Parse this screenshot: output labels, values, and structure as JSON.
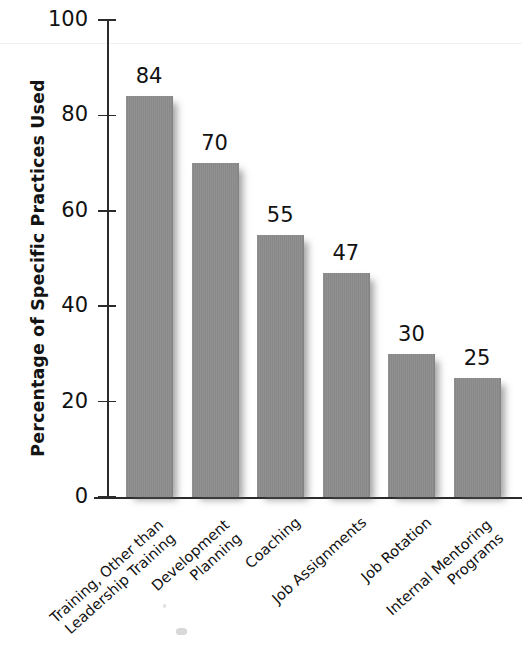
{
  "chart_data": {
    "type": "bar",
    "title": "",
    "xlabel": "",
    "ylabel": "Percentage of Specific Practices Used",
    "ylim": [
      0,
      100
    ],
    "ytick_values": [
      0,
      20,
      40,
      60,
      80,
      100
    ],
    "ytick_labels": [
      "0",
      "20",
      "40",
      "60",
      "80",
      "100"
    ],
    "grid": false,
    "legend": false,
    "bar_color": "#8b8b8b",
    "categories": [
      "Training, Other than\nLeadership Training",
      "Development\nPlanning",
      "Coaching",
      "Job Assignments",
      "Job Rotation",
      "Internal Mentoring\nPrograms"
    ],
    "values": [
      84,
      70,
      55,
      47,
      30,
      25
    ],
    "value_labels": [
      "84",
      "70",
      "55",
      "47",
      "30",
      "25"
    ]
  }
}
